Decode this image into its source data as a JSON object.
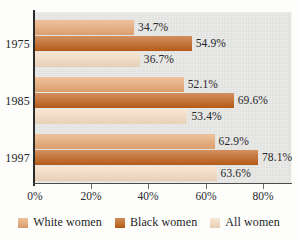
{
  "chart_data": {
    "type": "bar",
    "orientation": "horizontal",
    "title": "",
    "subtitle": "",
    "xlabel": "",
    "ylabel": "",
    "categories": [
      "1975",
      "1985",
      "1997"
    ],
    "xlim": [
      0,
      90
    ],
    "xticks": [
      0,
      20,
      40,
      60,
      80
    ],
    "xtick_labels": [
      "0%",
      "20%",
      "40%",
      "60%",
      "80%"
    ],
    "grid": false,
    "legend_position": "bottom",
    "series": [
      {
        "name": "White women",
        "color": "#e8a874",
        "values": [
          34.7,
          52.1,
          62.9
        ],
        "labels": [
          "34.7%",
          "52.1%",
          "62.9%"
        ]
      },
      {
        "name": "Black women",
        "color": "#c0601a",
        "values": [
          54.9,
          69.6,
          78.1
        ],
        "labels": [
          "54.9%",
          "69.6%",
          "78.1%"
        ]
      },
      {
        "name": "All women",
        "color": "#f6ddc3",
        "values": [
          36.7,
          53.4,
          63.6
        ],
        "labels": [
          "36.7%",
          "53.4%",
          "63.6%"
        ]
      }
    ]
  },
  "colors": {
    "plot_background": "#e6e6e4",
    "page_background": "#fdfdfc",
    "axis": "#2b2b2b",
    "white_women": "#e8a874",
    "black_women": "#c0601a",
    "all_women": "#f6ddc3"
  },
  "legend": {
    "items": [
      {
        "label": "White women",
        "color": "#e8a874"
      },
      {
        "label": "Black women",
        "color": "#c0601a"
      },
      {
        "label": "All women",
        "color": "#f6ddc3"
      }
    ]
  },
  "axis": {
    "x_tick_labels": [
      "0%",
      "20%",
      "40%",
      "60%",
      "80%"
    ],
    "y_tick_labels": [
      "1975",
      "1985",
      "1997"
    ]
  }
}
